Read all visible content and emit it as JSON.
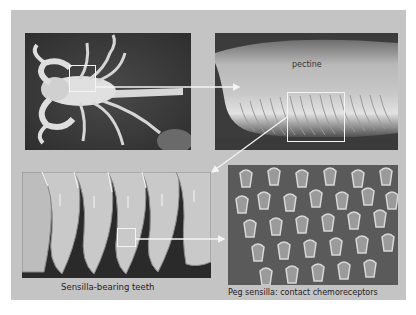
{
  "figure": {
    "background_color": "#c4c4c4",
    "panels": [
      {
        "id": "scorpion-overview",
        "description": "scorpion ventral view"
      },
      {
        "id": "pectine-closeup",
        "label": "pectine"
      },
      {
        "id": "teeth-sem",
        "caption": "Sensilla-bearing teeth"
      },
      {
        "id": "peg-sensilla-sem",
        "caption": "Peg sensilla: contact chemoreceptors"
      }
    ],
    "highlight_color": "#f4f4f4"
  }
}
